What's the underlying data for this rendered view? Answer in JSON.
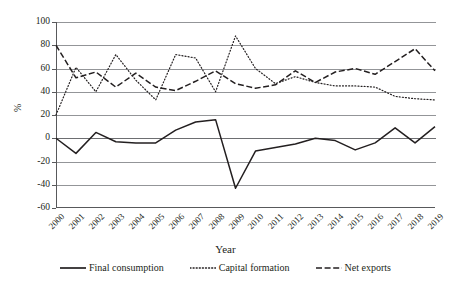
{
  "chart_data": {
    "type": "line",
    "title": "",
    "xlabel": "Year",
    "ylabel": "%",
    "ylim": [
      -60,
      100
    ],
    "yticks": [
      100,
      80,
      60,
      40,
      20,
      0,
      -20,
      -40,
      -60
    ],
    "ytick_labels": [
      "100",
      "80",
      "60",
      "40",
      "20",
      "0",
      "-20",
      "-40",
      "-60"
    ],
    "grid": true,
    "legend_position": "bottom",
    "categories": [
      "2000",
      "2001",
      "2002",
      "2003",
      "2004",
      "2005",
      "2006",
      "2007",
      "2008",
      "2009",
      "2010",
      "2011",
      "2012",
      "2013",
      "2014",
      "2015",
      "2016",
      "2017",
      "2018",
      "2019"
    ],
    "series": [
      {
        "name": "Final consumption",
        "style": "solid",
        "color": "#231f20",
        "values": [
          0,
          -13,
          5,
          -3,
          -4,
          -4,
          7,
          14,
          16,
          -43,
          -11,
          -8,
          -5,
          0,
          -2,
          -10,
          -4,
          9,
          -4,
          10
        ]
      },
      {
        "name": "Capital formation",
        "style": "dotted",
        "color": "#231f20",
        "values": [
          20,
          61,
          40,
          72,
          50,
          33,
          72,
          69,
          40,
          88,
          60,
          47,
          53,
          48,
          45,
          45,
          44,
          36,
          34,
          33
        ]
      },
      {
        "name": "Net exports",
        "style": "dashed",
        "color": "#231f20",
        "values": [
          80,
          52,
          57,
          44,
          56,
          44,
          41,
          49,
          58,
          47,
          43,
          46,
          58,
          48,
          57,
          60,
          55,
          66,
          77,
          58
        ]
      }
    ]
  },
  "legend": {
    "items": [
      {
        "label": "Final consumption"
      },
      {
        "label": "Capital formation"
      },
      {
        "label": "Net exports"
      }
    ]
  }
}
